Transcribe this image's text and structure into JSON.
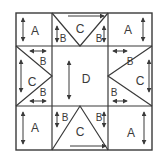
{
  "diagram": {
    "title": "",
    "colors": {
      "line": "#3a3a3a",
      "background": "#ffffff"
    },
    "pieces": {
      "corner_label": "A",
      "side_triangle_label": "B",
      "flying_goose_label": "C",
      "center_label": "D"
    },
    "labels": {
      "tl_a": "A",
      "tr_a": "A",
      "bl_a": "A",
      "br_a": "A",
      "top_c": "C",
      "top_b_left": "B",
      "top_b_right": "B",
      "left_c": "C",
      "left_b_top": "B",
      "left_b_bottom": "B",
      "right_c": "C",
      "right_b_top": "B",
      "right_b_bottom": "B",
      "bottom_c": "C",
      "bottom_b_left": "B",
      "bottom_b_right": "B",
      "center_d": "D"
    },
    "grain_arrows": "double-headed arrows indicate grain direction"
  }
}
